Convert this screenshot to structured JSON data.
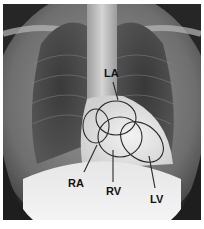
{
  "figure": {
    "type": "chest-xray-with-cardiac-chamber-annotations",
    "labels": {
      "la": "LA",
      "ra": "RA",
      "rv": "RV",
      "lv": "LV"
    },
    "caption": ""
  },
  "colors": {
    "outline": "#2a2a2a",
    "label": "#111111",
    "background": "#ffffff"
  }
}
